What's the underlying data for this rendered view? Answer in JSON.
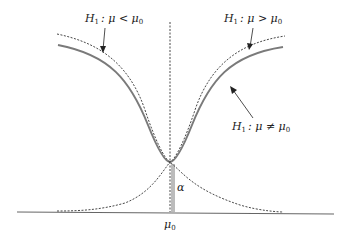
{
  "diagram": {
    "type": "power-function curves",
    "labels": {
      "left": {
        "H": "H",
        "sub": "1",
        "rel": ": μ < μ",
        "sub0": "0"
      },
      "right": {
        "H": "H",
        "sub": "1",
        "rel": ": μ > μ",
        "sub0": "0"
      },
      "two_sided": {
        "H": "H",
        "sub": "1",
        "rel": ": μ ≠ μ",
        "sub0": "0"
      },
      "alpha": "α",
      "mu0": "μ",
      "mu0_sub": "0"
    },
    "colors": {
      "solid_curve": "#777777",
      "dashed_curve": "#333333",
      "axis": "#555555"
    }
  }
}
